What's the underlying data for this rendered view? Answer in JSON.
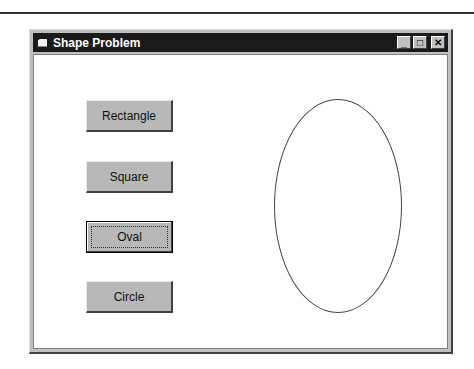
{
  "window": {
    "title": "Shape Problem",
    "controls": {
      "minimize": "_",
      "maximize": "□",
      "close": "✕"
    }
  },
  "buttons": [
    {
      "label": "Rectangle",
      "focused": false
    },
    {
      "label": "Square",
      "focused": false
    },
    {
      "label": "Oval",
      "focused": true
    },
    {
      "label": "Circle",
      "focused": false
    }
  ],
  "canvas": {
    "shape": "oval"
  }
}
